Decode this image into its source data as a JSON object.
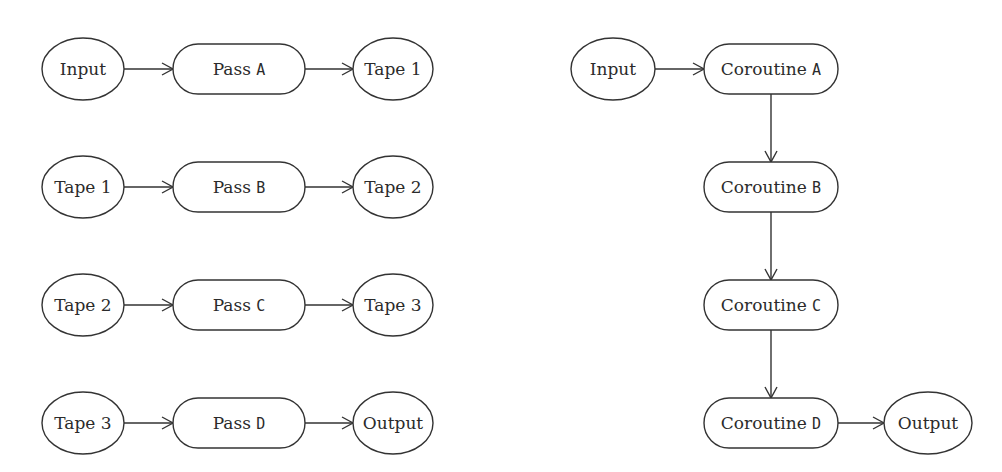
{
  "diagrams": {
    "multi_pass": {
      "rows": [
        {
          "input": "Input",
          "pass_prefix": "Pass",
          "pass_id": "A",
          "output": "Tape 1"
        },
        {
          "input": "Tape 1",
          "pass_prefix": "Pass",
          "pass_id": "B",
          "output": "Tape 2"
        },
        {
          "input": "Tape 2",
          "pass_prefix": "Pass",
          "pass_id": "C",
          "output": "Tape 3"
        },
        {
          "input": "Tape 3",
          "pass_prefix": "Pass",
          "pass_id": "D",
          "output": "Output"
        }
      ]
    },
    "coroutine": {
      "input": "Input",
      "stages": [
        {
          "prefix": "Coroutine",
          "id": "A"
        },
        {
          "prefix": "Coroutine",
          "id": "B"
        },
        {
          "prefix": "Coroutine",
          "id": "C"
        },
        {
          "prefix": "Coroutine",
          "id": "D"
        }
      ],
      "output": "Output"
    }
  }
}
